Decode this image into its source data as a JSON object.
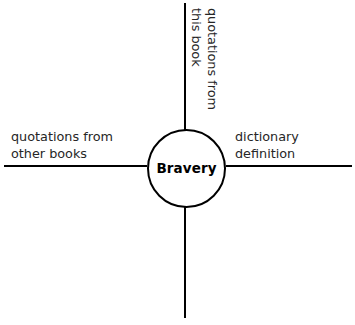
{
  "diagram": {
    "type": "concept-web",
    "background_color": "#ffffff",
    "line_color": "#000000",
    "text_color": "#262626",
    "center": {
      "label": "Bravery",
      "shape": "circle"
    },
    "branches": [
      {
        "id": "top",
        "label": "quotations from\nthis book",
        "direction": "up",
        "orientation": "vertical-rotated"
      },
      {
        "id": "right",
        "label": "dictionary\ndefinition",
        "direction": "right",
        "orientation": "horizontal"
      },
      {
        "id": "left",
        "label": "quotations from\nother books",
        "direction": "left",
        "orientation": "horizontal"
      },
      {
        "id": "bottom",
        "label": "",
        "direction": "down",
        "orientation": "horizontal"
      }
    ]
  }
}
